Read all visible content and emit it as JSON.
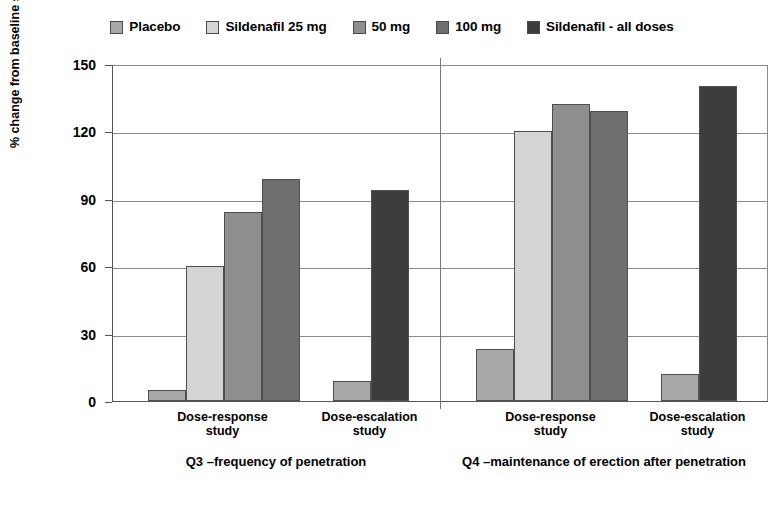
{
  "legend": {
    "items": [
      {
        "label": "Placebo",
        "color": "#a8a8a8",
        "swatch": "legend-swatch-placebo"
      },
      {
        "label": "Sildenafil 25 mg",
        "color": "#d4d4d4",
        "swatch": "legend-swatch-sildenafil-25mg"
      },
      {
        "label": "50 mg",
        "color": "#8f8f8f",
        "swatch": "legend-swatch-50mg"
      },
      {
        "label": "100 mg",
        "color": "#6e6e6e",
        "swatch": "legend-swatch-100mg"
      },
      {
        "label": "Sildenafil - all doses",
        "color": "#3d3d3d",
        "swatch": "legend-swatch-all-doses"
      }
    ]
  },
  "axis": {
    "y_title": "% change from baseline score",
    "y_ticks": [
      "150",
      "120",
      "90",
      "60",
      "30",
      "0"
    ]
  },
  "panels": [
    {
      "caption": "Q3 –frequency of penetration",
      "groups": [
        {
          "label": "Dose-response\nstudy"
        },
        {
          "label": "Dose-escalation\nstudy"
        }
      ]
    },
    {
      "caption": "Q4 –maintenance of erection after penetration",
      "groups": [
        {
          "label": "Dose-response\nstudy"
        },
        {
          "label": "Dose-escalation\nstudy"
        }
      ]
    }
  ],
  "chart_data": {
    "type": "bar",
    "title": "",
    "xlabel": "",
    "ylabel": "% change from baseline score",
    "ylim": [
      0,
      150
    ],
    "yticks": [
      0,
      30,
      60,
      90,
      120,
      150
    ],
    "grid": true,
    "legend_position": "top-center",
    "series": [
      {
        "name": "Placebo",
        "color": "#a8a8a8"
      },
      {
        "name": "Sildenafil 25 mg",
        "color": "#d4d4d4"
      },
      {
        "name": "50 mg",
        "color": "#8f8f8f"
      },
      {
        "name": "100 mg",
        "color": "#6e6e6e"
      },
      {
        "name": "Sildenafil - all doses",
        "color": "#3d3d3d"
      }
    ],
    "panels": [
      {
        "caption": "Q3 –frequency of penetration",
        "groups": [
          {
            "category": "Dose-response study",
            "bars": [
              {
                "series": "Placebo",
                "value": 5
              },
              {
                "series": "Sildenafil 25 mg",
                "value": 60
              },
              {
                "series": "50 mg",
                "value": 84
              },
              {
                "series": "100 mg",
                "value": 99
              }
            ]
          },
          {
            "category": "Dose-escalation study",
            "bars": [
              {
                "series": "Placebo",
                "value": 9
              },
              {
                "series": "Sildenafil - all doses",
                "value": 94
              }
            ]
          }
        ]
      },
      {
        "caption": "Q4 –maintenance of erection after penetration",
        "groups": [
          {
            "category": "Dose-response study",
            "bars": [
              {
                "series": "Placebo",
                "value": 23
              },
              {
                "series": "Sildenafil 25 mg",
                "value": 120
              },
              {
                "series": "50 mg",
                "value": 132
              },
              {
                "series": "100 mg",
                "value": 129
              }
            ]
          },
          {
            "category": "Dose-escalation study",
            "bars": [
              {
                "series": "Placebo",
                "value": 12
              },
              {
                "series": "Sildenafil - all doses",
                "value": 140
              }
            ]
          }
        ]
      }
    ]
  }
}
